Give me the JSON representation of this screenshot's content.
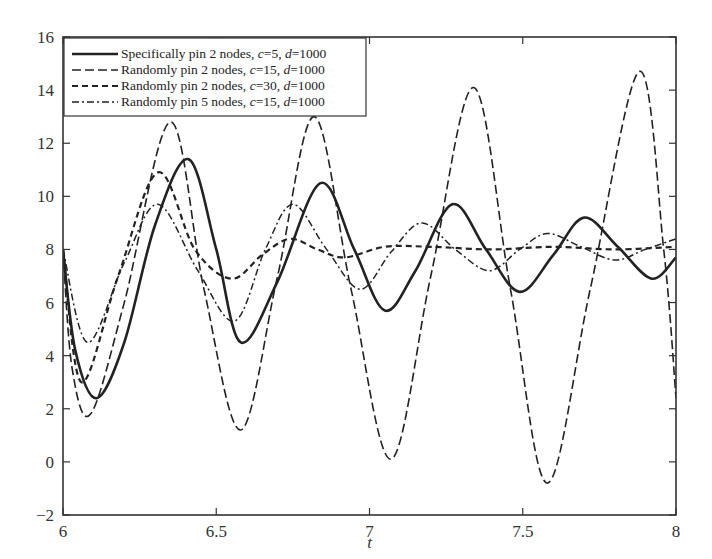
{
  "chart_data": {
    "type": "line",
    "title": "",
    "xlabel": "t",
    "ylabel": "",
    "xlim": [
      6,
      8
    ],
    "ylim": [
      -2,
      16
    ],
    "x_ticks": [
      "6",
      "6.5",
      "7",
      "7.5",
      "8"
    ],
    "y_ticks": [
      "-2",
      "0",
      "2",
      "4",
      "6",
      "8",
      "10",
      "12",
      "14",
      "16"
    ],
    "grid": false,
    "legend_position": "upper left",
    "series": [
      {
        "name": "Specifically pin 2 nodes, c=5, d=1000",
        "style": "solid",
        "x": [
          6.0,
          6.04,
          6.11,
          6.2,
          6.3,
          6.41,
          6.5,
          6.58,
          6.7,
          6.84,
          6.95,
          7.05,
          7.15,
          7.27,
          7.38,
          7.49,
          7.6,
          7.7,
          7.81,
          7.92,
          8.0
        ],
        "y": [
          8.0,
          4.2,
          2.4,
          4.5,
          8.9,
          11.4,
          8.0,
          4.5,
          6.8,
          10.5,
          8.0,
          5.7,
          7.2,
          9.7,
          8.0,
          6.4,
          7.8,
          9.2,
          8.1,
          6.9,
          7.7
        ]
      },
      {
        "name": "Randomly pin 2 nodes, c=15, d=1000",
        "style": "longdash",
        "x": [
          6.0,
          6.03,
          6.09,
          6.2,
          6.35,
          6.46,
          6.58,
          6.7,
          6.82,
          6.94,
          7.07,
          7.2,
          7.34,
          7.46,
          7.58,
          7.72,
          7.88,
          7.96,
          8.0
        ],
        "y": [
          8.0,
          3.5,
          1.8,
          6.0,
          12.8,
          6.5,
          1.2,
          7.0,
          13.0,
          6.5,
          0.1,
          7.0,
          14.1,
          6.5,
          -0.8,
          6.5,
          14.7,
          8.0,
          2.4
        ]
      },
      {
        "name": "Randomly pin 2 nodes, c=30, d=1000",
        "style": "dash",
        "x": [
          6.0,
          6.06,
          6.18,
          6.31,
          6.43,
          6.55,
          6.65,
          6.74,
          6.83,
          6.92,
          7.05,
          7.2,
          7.4,
          7.6,
          7.8,
          8.0
        ],
        "y": [
          8.0,
          3.0,
          7.0,
          10.9,
          8.0,
          6.9,
          7.8,
          8.4,
          8.0,
          7.7,
          8.1,
          8.1,
          8.0,
          8.1,
          8.0,
          8.1
        ]
      },
      {
        "name": "Randomly pin 5 nodes, c=15, d=1000",
        "style": "dashdot",
        "x": [
          6.0,
          6.08,
          6.2,
          6.31,
          6.44,
          6.56,
          6.66,
          6.75,
          6.86,
          6.97,
          7.07,
          7.17,
          7.28,
          7.39,
          7.49,
          7.58,
          7.69,
          7.8,
          7.9,
          8.0
        ],
        "y": [
          8.0,
          4.5,
          7.5,
          9.7,
          7.2,
          5.3,
          8.0,
          9.7,
          8.0,
          6.5,
          7.9,
          9.0,
          8.0,
          7.2,
          8.0,
          8.6,
          8.1,
          7.6,
          8.0,
          8.4
        ]
      }
    ]
  },
  "legend": {
    "items": [
      {
        "prefix": "Specifically pin 2 nodes, ",
        "c": "c",
        "cval": "=5, ",
        "d": "d",
        "dval": "=1000"
      },
      {
        "prefix": "Randomly pin 2 nodes, ",
        "c": "c",
        "cval": "=15, ",
        "d": "d",
        "dval": "=1000"
      },
      {
        "prefix": "Randomly pin 2 nodes, ",
        "c": "c",
        "cval": "=30, ",
        "d": "d",
        "dval": "=1000"
      },
      {
        "prefix": "Randomly pin 5 nodes, ",
        "c": "c",
        "cval": "=15, ",
        "d": "d",
        "dval": "=1000"
      }
    ]
  }
}
